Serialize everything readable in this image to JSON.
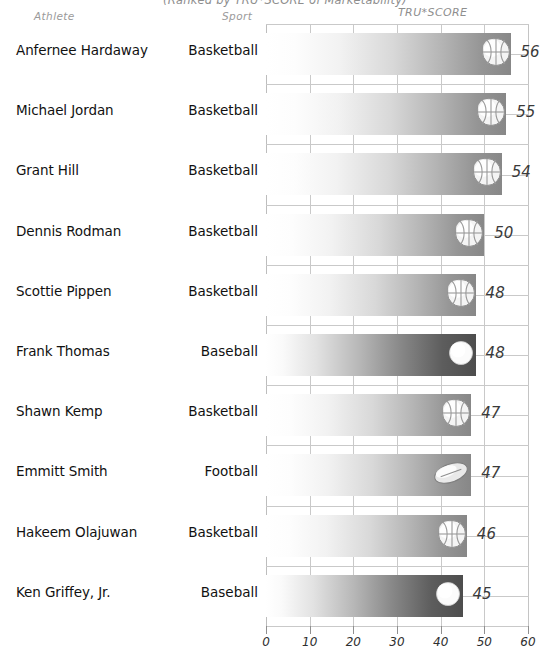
{
  "title": "(Ranked by TRU*SCORE of Marketability)",
  "headers": {
    "athlete": "Athlete",
    "sport": "Sport",
    "score": "TRU*SCORE"
  },
  "chart_data": {
    "type": "bar",
    "title": "(Ranked by TRU*SCORE of Marketability)",
    "xlabel": "",
    "ylabel": "",
    "xlim": [
      0,
      60
    ],
    "orientation": "horizontal",
    "grid": true,
    "legend": "none",
    "categories": [
      "Anfernee Hardaway",
      "Michael Jordan",
      "Grant Hill",
      "Dennis Rodman",
      "Scottie Pippen",
      "Frank Thomas",
      "Shawn Kemp",
      "Emmitt Smith",
      "Hakeem Olajuwan",
      "Ken Griffey, Jr."
    ],
    "values": [
      56,
      55,
      54,
      50,
      48,
      48,
      47,
      47,
      46,
      45
    ],
    "xticks": [
      0,
      10,
      20,
      30,
      40,
      50,
      60
    ],
    "xticklabels": [
      "0",
      "10",
      "20",
      "30",
      "40",
      "50",
      "60"
    ]
  },
  "rows": [
    {
      "athlete": "Anfernee Hardaway",
      "sport": "Basketball",
      "score": 56,
      "score_label": "56",
      "icon": "basketball-icon",
      "bar_style": "light"
    },
    {
      "athlete": "Michael Jordan",
      "sport": "Basketball",
      "score": 55,
      "score_label": "55",
      "icon": "basketball-icon",
      "bar_style": "light"
    },
    {
      "athlete": "Grant Hill",
      "sport": "Basketball",
      "score": 54,
      "score_label": "54",
      "icon": "basketball-icon",
      "bar_style": "light"
    },
    {
      "athlete": "Dennis Rodman",
      "sport": "Basketball",
      "score": 50,
      "score_label": "50",
      "icon": "basketball-icon",
      "bar_style": "light"
    },
    {
      "athlete": "Scottie Pippen",
      "sport": "Basketball",
      "score": 48,
      "score_label": "48",
      "icon": "basketball-icon",
      "bar_style": "light"
    },
    {
      "athlete": "Frank Thomas",
      "sport": "Baseball",
      "score": 48,
      "score_label": "48",
      "icon": "baseball-icon",
      "bar_style": "dark"
    },
    {
      "athlete": "Shawn Kemp",
      "sport": "Basketball",
      "score": 47,
      "score_label": "47",
      "icon": "basketball-icon",
      "bar_style": "light"
    },
    {
      "athlete": "Emmitt Smith",
      "sport": "Football",
      "score": 47,
      "score_label": "47",
      "icon": "football-icon",
      "bar_style": "light"
    },
    {
      "athlete": "Hakeem Olajuwan",
      "sport": "Basketball",
      "score": 46,
      "score_label": "46",
      "icon": "basketball-icon",
      "bar_style": "light"
    },
    {
      "athlete": "Ken Griffey, Jr.",
      "sport": "Baseball",
      "score": 45,
      "score_label": "45",
      "icon": "baseball-icon",
      "bar_style": "dark"
    }
  ],
  "axis": {
    "ticks": [
      "0",
      "10",
      "20",
      "30",
      "40",
      "50",
      "60"
    ]
  },
  "colors": {
    "gridline": "#c9c9c9",
    "bar_light_end": "#878787",
    "bar_dark_end": "#4d4d4d",
    "text": "#111111",
    "header_text": "#9a9a9a"
  }
}
